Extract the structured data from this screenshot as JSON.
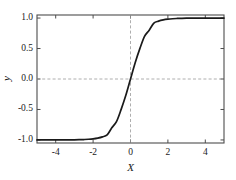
{
  "chart_data": {
    "type": "line",
    "title": "",
    "subtitle": "",
    "xlabel": "X",
    "ylabel": "y",
    "xlim": [
      -5,
      5
    ],
    "ylim": [
      -1.05,
      1.05
    ],
    "xticks": [
      -4,
      -2,
      0,
      2,
      4
    ],
    "xtick_labels": [
      "-4",
      "-2",
      "0",
      "2",
      "4"
    ],
    "yticks": [
      -1.0,
      -0.5,
      0.0,
      0.5,
      1.0
    ],
    "ytick_labels": [
      "-1.0",
      "-0.5",
      "0.0",
      "0.5",
      "1.0"
    ],
    "grid": false,
    "reference_lines": [
      {
        "name": "y-zero-line",
        "orientation": "horizontal",
        "value": 0.0,
        "style": "dashed"
      },
      {
        "name": "x-zero-line",
        "orientation": "vertical",
        "value": 0.0,
        "style": "dashed"
      }
    ],
    "legend": null,
    "legend_position": "none",
    "line_color": "#1a1a1a",
    "line_width": 1.7,
    "frame_color": "#4d4d4d",
    "dash_color": "#999999",
    "series": [
      {
        "name": "tanh",
        "formula": "y = tanh(1.1 * x)",
        "x": [
          -5.0,
          -4.75,
          -4.5,
          -4.25,
          -4.0,
          -3.75,
          -3.5,
          -3.25,
          -3.0,
          -2.75,
          -2.5,
          -2.25,
          -2.0,
          -1.75,
          -1.5,
          -1.25,
          -1.0,
          -0.75,
          -0.5,
          -0.25,
          0.0,
          0.25,
          0.5,
          0.75,
          1.0,
          1.25,
          1.5,
          1.75,
          2.0,
          2.25,
          2.5,
          2.75,
          3.0,
          3.25,
          3.5,
          3.75,
          4.0,
          4.25,
          4.5,
          4.75,
          5.0
        ],
        "y": [
          -1.0,
          -0.9999,
          -0.9999,
          -0.9998,
          -0.9996,
          -0.9994,
          -0.999,
          -0.9984,
          -0.9974,
          -0.9957,
          -0.993,
          -0.9886,
          -0.9813,
          -0.9693,
          -0.9495,
          -0.9175,
          -0.8005,
          -0.7,
          -0.4987,
          -0.2679,
          0.0,
          0.2679,
          0.4987,
          0.7,
          0.8005,
          0.9175,
          0.9495,
          0.9693,
          0.9813,
          0.9886,
          0.993,
          0.9957,
          0.9974,
          0.9984,
          0.999,
          0.9994,
          0.9996,
          0.9998,
          0.9999,
          0.9999,
          1.0
        ]
      }
    ]
  },
  "figure": {
    "background": "#ffffff",
    "plot_left_px": 37,
    "plot_top_px": 15,
    "plot_right_px": 224,
    "plot_bottom_px": 143
  }
}
